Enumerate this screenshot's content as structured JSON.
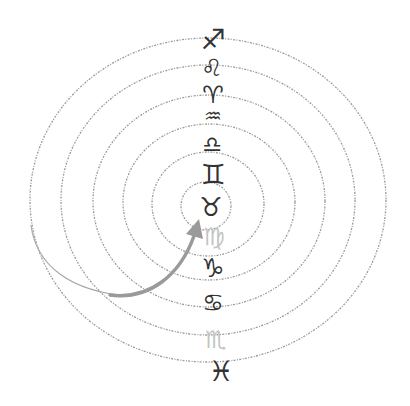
{
  "diagram": {
    "rings": [
      {
        "cx": 208,
        "cy": 200,
        "rx": 178,
        "ry": 162
      },
      {
        "cx": 208,
        "cy": 200,
        "rx": 147,
        "ry": 135
      },
      {
        "cx": 209,
        "cy": 201,
        "rx": 116,
        "ry": 106
      },
      {
        "cx": 209,
        "cy": 202,
        "rx": 86,
        "ry": 78
      },
      {
        "cx": 208,
        "cy": 204,
        "rx": 56,
        "ry": 52
      },
      {
        "cx": 206,
        "cy": 206,
        "rx": 25,
        "ry": 24
      }
    ],
    "ring_color": "#9a9a9a",
    "arrow": {
      "color": "#9a9a9a",
      "start": [
        31,
        225
      ],
      "tip": [
        199,
        222
      ]
    },
    "symbols": [
      {
        "name": "sagittarius",
        "glyph": "♐",
        "x": 213,
        "y": 40,
        "size": 28,
        "faded": false
      },
      {
        "name": "leo",
        "glyph": "♌",
        "x": 212,
        "y": 68,
        "size": 24,
        "faded": false
      },
      {
        "name": "aries",
        "glyph": "♈",
        "x": 213,
        "y": 95,
        "size": 24,
        "faded": false
      },
      {
        "name": "aquarius",
        "glyph": "♒",
        "x": 213,
        "y": 116,
        "size": 20,
        "faded": false
      },
      {
        "name": "libra",
        "glyph": "♎",
        "x": 212,
        "y": 145,
        "size": 22,
        "faded": false
      },
      {
        "name": "gemini",
        "glyph": "♊",
        "x": 213,
        "y": 175,
        "size": 28,
        "faded": false
      },
      {
        "name": "taurus",
        "glyph": "♉",
        "x": 211,
        "y": 207,
        "size": 26,
        "faded": false
      },
      {
        "name": "virgo",
        "glyph": "♍",
        "x": 214,
        "y": 237,
        "size": 24,
        "faded": true
      },
      {
        "name": "capricorn",
        "glyph": "♑",
        "x": 213,
        "y": 268,
        "size": 26,
        "faded": false
      },
      {
        "name": "cancer",
        "glyph": "♋",
        "x": 213,
        "y": 303,
        "size": 24,
        "faded": false
      },
      {
        "name": "scorpio",
        "glyph": "♏",
        "x": 216,
        "y": 340,
        "size": 24,
        "faded": true
      },
      {
        "name": "pisces",
        "glyph": "♓",
        "x": 221,
        "y": 372,
        "size": 28,
        "faded": false
      }
    ]
  }
}
